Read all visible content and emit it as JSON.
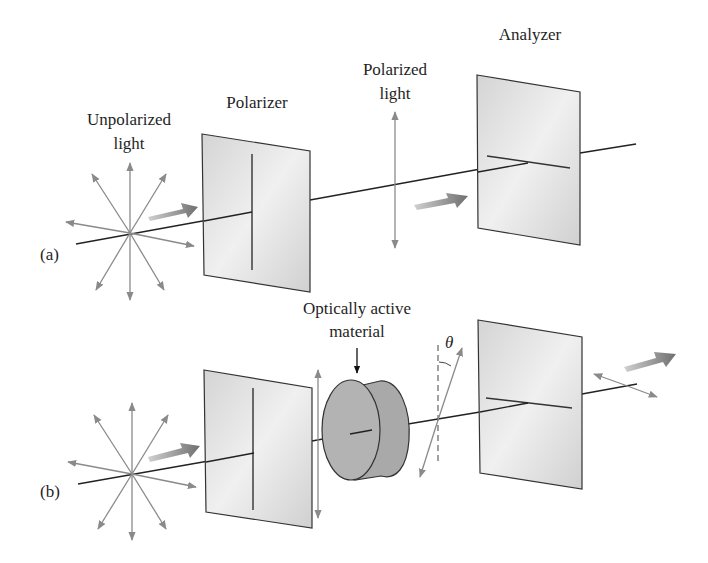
{
  "figure": {
    "panels": [
      {
        "id": "a",
        "label": "(a)",
        "components": {
          "source_label": [
            "Unpolarized",
            "light"
          ],
          "polarizer_label": "Polarizer",
          "polarized_label": [
            "Polarized",
            "light"
          ],
          "analyzer_label": "Analyzer"
        }
      },
      {
        "id": "b",
        "label": "(b)",
        "components": {
          "material_label": [
            "Optically active",
            "material"
          ],
          "rotation_symbol": "θ"
        }
      }
    ],
    "colors": {
      "panel_fill": "#dcdcdc",
      "arrow_gray": "#8a8a8a",
      "material_fill": "#a8a8a8",
      "line": "#222222"
    }
  }
}
